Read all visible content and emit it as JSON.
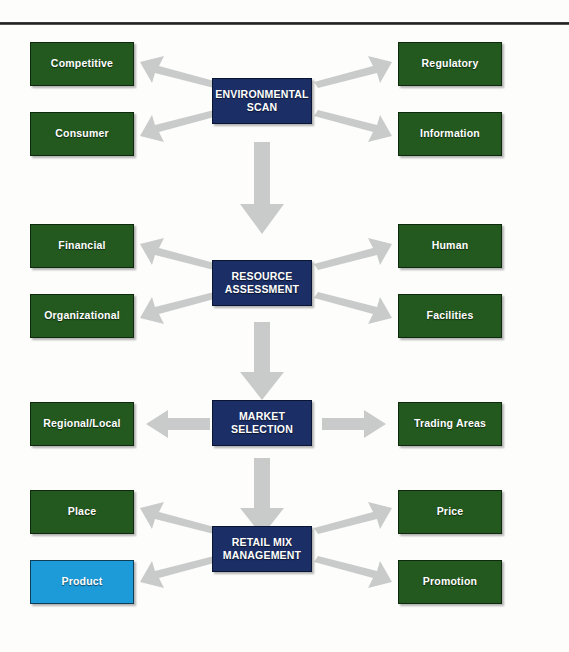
{
  "diagram": {
    "colors": {
      "leaf_green": "#23581f",
      "core_navy": "#1b2f66",
      "highlight_blue": "#1d9ad8",
      "arrow_gray": "#c9cbcb",
      "text_white": "#ffffff",
      "rule_dark": "#1c1c1c"
    },
    "stages": [
      {
        "id": "environmental-scan",
        "core_label": "ENVIRONMENTAL\nSCAN",
        "left_items": [
          {
            "id": "competitive",
            "label": "Competitive",
            "highlight": false
          },
          {
            "id": "consumer",
            "label": "Consumer",
            "highlight": false
          }
        ],
        "right_items": [
          {
            "id": "regulatory",
            "label": "Regulatory",
            "highlight": false
          },
          {
            "id": "information",
            "label": "Information",
            "highlight": false
          }
        ]
      },
      {
        "id": "resource-assessment",
        "core_label": "RESOURCE\nASSESSMENT",
        "left_items": [
          {
            "id": "financial",
            "label": "Financial",
            "highlight": false
          },
          {
            "id": "organizational",
            "label": "Organizational",
            "highlight": false
          }
        ],
        "right_items": [
          {
            "id": "human",
            "label": "Human",
            "highlight": false
          },
          {
            "id": "facilities",
            "label": "Facilities",
            "highlight": false
          }
        ]
      },
      {
        "id": "market-selection",
        "core_label": "MARKET\nSELECTION",
        "left_items": [
          {
            "id": "regional-local",
            "label": "Regional/Local",
            "highlight": false
          }
        ],
        "right_items": [
          {
            "id": "trading-areas",
            "label": "Trading Areas",
            "highlight": false
          }
        ]
      },
      {
        "id": "retail-mix-management",
        "core_label": "RETAIL MIX\nMANAGEMENT",
        "left_items": [
          {
            "id": "place",
            "label": "Place",
            "highlight": false
          },
          {
            "id": "product",
            "label": "Product",
            "highlight": true
          }
        ],
        "right_items": [
          {
            "id": "price",
            "label": "Price",
            "highlight": false
          },
          {
            "id": "promotion",
            "label": "Promotion",
            "highlight": false
          }
        ]
      }
    ],
    "connectors": [
      {
        "id": "scan-to-competitive",
        "kind": "arrow-up-left"
      },
      {
        "id": "scan-to-consumer",
        "kind": "arrow-down-left"
      },
      {
        "id": "scan-to-regulatory",
        "kind": "arrow-up-right"
      },
      {
        "id": "scan-to-information",
        "kind": "arrow-down-right"
      },
      {
        "id": "scan-to-resource",
        "kind": "arrow-down"
      },
      {
        "id": "resource-to-financial",
        "kind": "arrow-up-left"
      },
      {
        "id": "resource-to-organizational",
        "kind": "arrow-down-left"
      },
      {
        "id": "resource-to-human",
        "kind": "arrow-up-right"
      },
      {
        "id": "resource-to-facilities",
        "kind": "arrow-down-right"
      },
      {
        "id": "resource-to-market",
        "kind": "arrow-down"
      },
      {
        "id": "market-to-regional",
        "kind": "arrow-left"
      },
      {
        "id": "market-to-trading",
        "kind": "arrow-right"
      },
      {
        "id": "market-to-retailmix",
        "kind": "arrow-down"
      },
      {
        "id": "retailmix-to-place",
        "kind": "arrow-up-left"
      },
      {
        "id": "retailmix-to-product",
        "kind": "arrow-down-left"
      },
      {
        "id": "retailmix-to-price",
        "kind": "arrow-up-right"
      },
      {
        "id": "retailmix-to-promotion",
        "kind": "arrow-down-right"
      }
    ]
  }
}
